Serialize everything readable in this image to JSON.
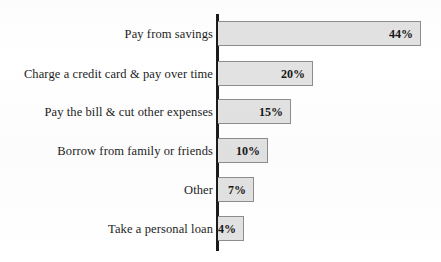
{
  "chart_data": {
    "type": "bar",
    "orientation": "horizontal",
    "title": "",
    "subtitle": "",
    "xlabel": "",
    "ylabel": "",
    "grid": false,
    "legend": "none",
    "xlim": [
      0,
      44
    ],
    "categories": [
      "Pay from savings",
      "Charge a credit card & pay over time",
      "Pay the bill & cut other expenses",
      "Borrow from family or friends",
      "Other",
      "Take a personal loan"
    ],
    "values": [
      44,
      20,
      15,
      10,
      7,
      4
    ],
    "data_labels": [
      "44%",
      "20%",
      "15%",
      "10%",
      "7%",
      "4%"
    ],
    "colors": {
      "bar_fill": "#e2e2e2",
      "bar_border": "#8d8d8d",
      "axis_line": "#1b1b1b",
      "label_text": "#1c1c1c",
      "background": "#ffffff"
    }
  },
  "bars": [
    {
      "label": "Pay from savings",
      "value": "44%",
      "width_px": 203,
      "top_px": 21
    },
    {
      "label": "Charge a credit card & pay over time",
      "value": "20%",
      "width_px": 95,
      "top_px": 61
    },
    {
      "label": "Pay the bill & cut other expenses",
      "value": "15%",
      "width_px": 73,
      "top_px": 99
    },
    {
      "label": "Borrow from family or friends",
      "value": "10%",
      "width_px": 50,
      "top_px": 138
    },
    {
      "label": "Other",
      "value": "7%",
      "width_px": 36,
      "top_px": 177
    },
    {
      "label": "Take a personal loan",
      "value": "4%",
      "width_px": 26,
      "top_px": 216
    }
  ]
}
